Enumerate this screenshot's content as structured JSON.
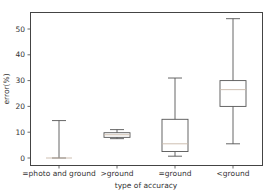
{
  "chart_data": {
    "type": "boxplot",
    "title": "",
    "xlabel": "type of accuracy",
    "ylabel": "error(%)",
    "ylim": [
      -2.5,
      57
    ],
    "yticks": [
      0,
      10,
      20,
      30,
      40,
      50
    ],
    "grid": false,
    "legend": null,
    "categories": [
      "=photo and ground",
      ">ground",
      "=ground",
      "<ground"
    ],
    "series": [
      {
        "name": "=photo and ground",
        "whisker_low": 0,
        "q1": 0,
        "median": 0,
        "q3": 0,
        "whisker_high": 14.5
      },
      {
        "name": ">ground",
        "whisker_low": 7.5,
        "q1": 8,
        "median": 9,
        "q3": 9.8,
        "whisker_high": 11
      },
      {
        "name": "=ground",
        "whisker_low": 0.7,
        "q1": 2.5,
        "median": 5.5,
        "q3": 15,
        "whisker_high": 31
      },
      {
        "name": "<ground",
        "whisker_low": 5.5,
        "q1": 20,
        "median": 26.5,
        "q3": 30,
        "whisker_high": 54
      }
    ]
  },
  "colors": {
    "box_edge": "#555555",
    "median": "#c8b8a8",
    "axis": "#444444"
  }
}
